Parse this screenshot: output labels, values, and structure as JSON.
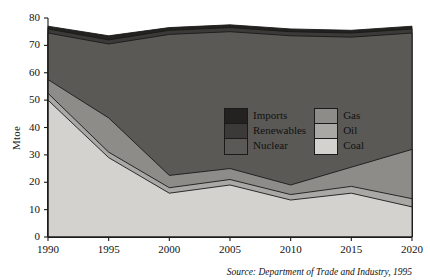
{
  "chart_data": {
    "type": "area",
    "stacked": true,
    "title": "",
    "xlabel": "",
    "ylabel": "Mtoe",
    "x": [
      1990,
      1995,
      2000,
      2005,
      2010,
      2015,
      2020
    ],
    "categories": [
      "1990",
      "1995",
      "2000",
      "2005",
      "2010",
      "2015",
      "2020"
    ],
    "xlim": [
      1990,
      2020
    ],
    "ylim": [
      0,
      80
    ],
    "yticks": [
      0,
      10,
      20,
      30,
      40,
      50,
      60,
      70,
      80
    ],
    "ytick_labels": [
      "0",
      "10",
      "20",
      "30",
      "40",
      "50",
      "60",
      "70",
      "80"
    ],
    "grid": false,
    "legend_position": "inside-center-right",
    "stack_order_bottom_to_top": [
      "Coal",
      "Oil",
      "Gas",
      "Nuclear",
      "Renewables",
      "Imports"
    ],
    "series": [
      {
        "name": "Coal",
        "color": "#d4d2ce",
        "values": [
          50.0,
          29.0,
          16.0,
          19.0,
          13.5,
          16.0,
          11.0
        ]
      },
      {
        "name": "Oil",
        "color": "#a9a8a4",
        "values": [
          2.5,
          2.0,
          2.0,
          2.0,
          2.0,
          2.5,
          3.0
        ]
      },
      {
        "name": "Gas",
        "color": "#8d8c89",
        "values": [
          5.0,
          12.5,
          4.5,
          4.0,
          3.5,
          7.0,
          18.0
        ]
      },
      {
        "name": "Nuclear",
        "color": "#5a5956",
        "values": [
          17.0,
          27.0,
          51.5,
          50.0,
          54.5,
          47.5,
          42.5
        ]
      },
      {
        "name": "Renewables",
        "color": "#3b3a38",
        "values": [
          1.5,
          1.5,
          1.5,
          1.5,
          1.5,
          1.5,
          1.5
        ]
      },
      {
        "name": "Imports",
        "color": "#232220",
        "values": [
          1.0,
          1.5,
          1.0,
          1.0,
          1.0,
          1.0,
          1.0
        ]
      }
    ],
    "totals": [
      77.0,
      73.5,
      76.5,
      77.5,
      76.0,
      75.5,
      77.0
    ],
    "annotations": {
      "source": "Source: Department of Trade and Industry, 1995"
    }
  },
  "legend": {
    "left_column": [
      {
        "label": "Imports",
        "color": "#232220"
      },
      {
        "label": "Renewables",
        "color": "#3b3a38"
      },
      {
        "label": "Nuclear",
        "color": "#5a5956"
      }
    ],
    "right_column": [
      {
        "label": "Gas",
        "color": "#8d8c89"
      },
      {
        "label": "Oil",
        "color": "#a9a8a4"
      },
      {
        "label": "Coal",
        "color": "#d4d2ce"
      }
    ]
  },
  "axes": {
    "y_axis_title": "Mtoe",
    "y_ticks": [
      "80",
      "70",
      "60",
      "50",
      "40",
      "30",
      "20",
      "10",
      "0"
    ],
    "x_ticks": [
      "1990",
      "1995",
      "2000",
      "2005",
      "2010",
      "2015",
      "2020"
    ]
  },
  "footer": {
    "source": "Source: Department of Trade and Industry, 1995"
  },
  "colors": {
    "background": "#ffffff",
    "axis": "#1a1a1a",
    "text": "#111111"
  }
}
